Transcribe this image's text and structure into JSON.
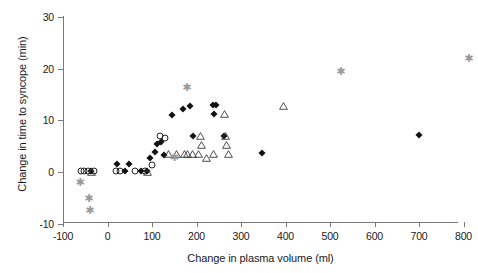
{
  "chart_data": {
    "type": "scatter",
    "title": "",
    "xlabel": "Change in plasma volume (ml)",
    "ylabel": "Change in time to syncope (min)",
    "xlim": [
      -100,
      830
    ],
    "ylim": [
      -10,
      30
    ],
    "xticks": [
      -100,
      0,
      100,
      200,
      300,
      400,
      500,
      600,
      700,
      800
    ],
    "xtick_labels": [
      "-100",
      "0",
      "100",
      "200",
      "300",
      "400",
      "500",
      "600",
      "700",
      "800"
    ],
    "yticks": [
      -10,
      0,
      10,
      20,
      30
    ],
    "ytick_labels": [
      "-10",
      "0",
      "10",
      "20",
      "30"
    ],
    "grid": false,
    "legend": "none",
    "series": [
      {
        "name": "open-circle",
        "marker": "open-circle",
        "color": "#222222",
        "points": [
          {
            "x": -60,
            "y": 0.2
          },
          {
            "x": -52,
            "y": 0.2
          },
          {
            "x": -44,
            "y": 0.2
          },
          {
            "x": -30,
            "y": 0.2
          },
          {
            "x": 18,
            "y": 0.2
          },
          {
            "x": 28,
            "y": 0.2
          },
          {
            "x": 62,
            "y": 0.2
          },
          {
            "x": 84,
            "y": 0.2
          },
          {
            "x": 100,
            "y": 1.3
          },
          {
            "x": 118,
            "y": 6.9
          },
          {
            "x": 130,
            "y": 6.6
          }
        ]
      },
      {
        "name": "filled-diamond",
        "marker": "filled-diamond",
        "color": "#111111",
        "points": [
          {
            "x": -38,
            "y": 0.2
          },
          {
            "x": 22,
            "y": 1.6
          },
          {
            "x": 40,
            "y": 0.2
          },
          {
            "x": 48,
            "y": 1.6
          },
          {
            "x": 76,
            "y": 0.2
          },
          {
            "x": 88,
            "y": 0.2
          },
          {
            "x": 96,
            "y": 2.7
          },
          {
            "x": 106,
            "y": 3.9
          },
          {
            "x": 112,
            "y": 5.4
          },
          {
            "x": 120,
            "y": 5.9
          },
          {
            "x": 126,
            "y": 3.3
          },
          {
            "x": 146,
            "y": 11.0
          },
          {
            "x": 170,
            "y": 12.3
          },
          {
            "x": 186,
            "y": 12.8
          },
          {
            "x": 192,
            "y": 6.9
          },
          {
            "x": 236,
            "y": 12.9
          },
          {
            "x": 244,
            "y": 12.9
          },
          {
            "x": 240,
            "y": 11.3
          },
          {
            "x": 262,
            "y": 7.0
          },
          {
            "x": 348,
            "y": 3.6
          },
          {
            "x": 700,
            "y": 7.2
          }
        ]
      },
      {
        "name": "open-triangle",
        "marker": "open-triangle",
        "color": "#3a3a3a",
        "points": [
          {
            "x": -36,
            "y": 0.0
          },
          {
            "x": 90,
            "y": 0.0
          },
          {
            "x": 136,
            "y": 3.4
          },
          {
            "x": 156,
            "y": 3.4
          },
          {
            "x": 172,
            "y": 3.5
          },
          {
            "x": 180,
            "y": 3.5
          },
          {
            "x": 192,
            "y": 3.5
          },
          {
            "x": 204,
            "y": 3.4
          },
          {
            "x": 208,
            "y": 6.9
          },
          {
            "x": 212,
            "y": 5.3
          },
          {
            "x": 222,
            "y": 2.7
          },
          {
            "x": 238,
            "y": 3.5
          },
          {
            "x": 264,
            "y": 11.2
          },
          {
            "x": 266,
            "y": 6.9
          },
          {
            "x": 268,
            "y": 5.3
          },
          {
            "x": 272,
            "y": 3.4
          },
          {
            "x": 396,
            "y": 12.8
          }
        ]
      },
      {
        "name": "grey-asterisk",
        "marker": "asterisk",
        "color": "#9a9a9a",
        "points": [
          {
            "x": -62,
            "y": -1.9
          },
          {
            "x": -42,
            "y": -5.0
          },
          {
            "x": -40,
            "y": -7.3
          },
          {
            "x": 150,
            "y": 2.9
          },
          {
            "x": 178,
            "y": 16.4
          },
          {
            "x": 524,
            "y": 19.5
          },
          {
            "x": 812,
            "y": 22.1
          }
        ]
      }
    ]
  }
}
